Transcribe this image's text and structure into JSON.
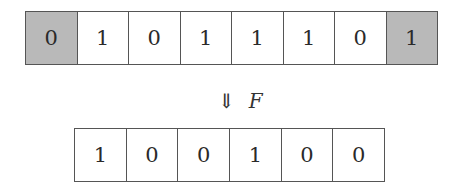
{
  "diagram": {
    "input_row": {
      "cells": [
        {
          "value": "0",
          "shaded": true
        },
        {
          "value": "1",
          "shaded": false
        },
        {
          "value": "0",
          "shaded": false
        },
        {
          "value": "1",
          "shaded": false
        },
        {
          "value": "1",
          "shaded": false
        },
        {
          "value": "1",
          "shaded": false
        },
        {
          "value": "0",
          "shaded": false
        },
        {
          "value": "1",
          "shaded": true
        }
      ]
    },
    "operator": {
      "arrow": "⇓",
      "label": "F"
    },
    "output_row": {
      "cells": [
        {
          "value": "1"
        },
        {
          "value": "0"
        },
        {
          "value": "0"
        },
        {
          "value": "1"
        },
        {
          "value": "0"
        },
        {
          "value": "0"
        }
      ]
    },
    "colors": {
      "shaded_cell": "#b9b9b9",
      "border": "#555555",
      "text": "#2a2a2a"
    }
  }
}
